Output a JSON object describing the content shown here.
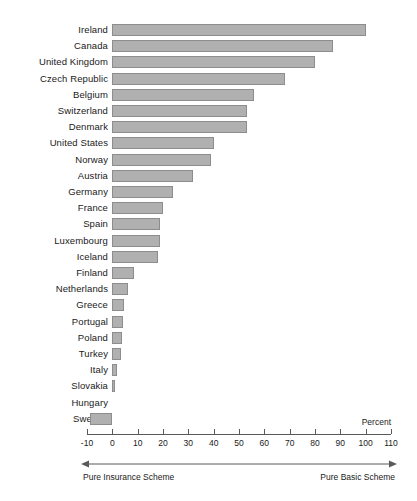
{
  "chart_data": {
    "type": "bar",
    "orientation": "horizontal",
    "title": "",
    "subtitle": "",
    "xlabel": "Percent",
    "ylabel": "",
    "xlim": [
      -10,
      110
    ],
    "grid": false,
    "legend": null,
    "tick_labels": [
      "-10",
      "0",
      "10",
      "20",
      "30",
      "40",
      "50",
      "60",
      "70",
      "80",
      "90",
      "100",
      "110"
    ],
    "ticks": [
      -10,
      0,
      10,
      20,
      30,
      40,
      50,
      60,
      70,
      80,
      90,
      100,
      110
    ],
    "categories": [
      "Ireland",
      "Canada",
      "United Kingdom",
      "Czech Republic",
      "Belgium",
      "Switzerland",
      "Denmark",
      "United States",
      "Norway",
      "Austria",
      "Germany",
      "France",
      "Spain",
      "Luxembourg",
      "Iceland",
      "Finland",
      "Netherlands",
      "Greece",
      "Portugal",
      "Poland",
      "Turkey",
      "Italy",
      "Slovakia",
      "Hungary",
      "Sweden"
    ],
    "values": [
      100,
      87,
      80,
      68,
      56,
      53,
      53,
      40,
      39,
      32,
      24,
      20,
      19,
      19,
      18,
      8.5,
      6,
      4.8,
      4.4,
      4,
      3.6,
      2,
      1.2,
      0,
      -8.7
    ],
    "annotations": [
      {
        "text": "Pure Insurance Scheme",
        "position": "bottom-left"
      },
      {
        "text": "Pure Basic Scheme",
        "position": "bottom-right"
      }
    ],
    "colors": {
      "bar_fill": "#b0b0b0",
      "bar_stroke": "#8d8d8d",
      "axis": "#5a5a5a",
      "text": "#1a1a1a",
      "background": "#ffffff"
    }
  },
  "axis_footer": {
    "left_label": "Pure Insurance Scheme",
    "right_label": "Pure Basic Scheme"
  },
  "unit_label": "Percent"
}
